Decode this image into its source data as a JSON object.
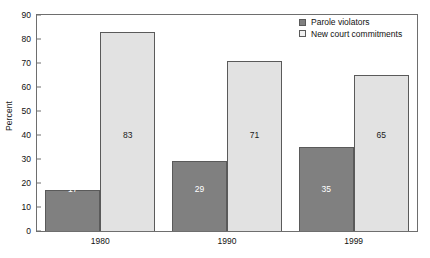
{
  "chart_data": {
    "type": "bar",
    "title": "",
    "subtitle": "",
    "xlabel": "",
    "ylabel": "Percent",
    "categories": [
      "1980",
      "1990",
      "1999"
    ],
    "series": [
      {
        "name": "Parole violators",
        "color": "#808080",
        "values": [
          17,
          29,
          35
        ],
        "value_labels": [
          "17",
          "29",
          "35"
        ]
      },
      {
        "name": "New court commitments",
        "color": "#e2e2e2",
        "values": [
          83,
          71,
          65
        ],
        "value_labels": [
          "83",
          "71",
          "65"
        ]
      }
    ],
    "ylim": [
      0,
      90
    ],
    "ytick_step": 10,
    "ytick_labels": [
      "0",
      "10",
      "20",
      "30",
      "40",
      "50",
      "60",
      "70",
      "80",
      "90"
    ],
    "grid": false,
    "legend_position": "top-right",
    "frame": true,
    "annotations": []
  },
  "legend": {
    "items": [
      {
        "label": "Parole violators",
        "swatch": "dark-gray-swatch"
      },
      {
        "label": "New court commitments",
        "swatch": "light-gray-swatch"
      }
    ]
  },
  "axes": {
    "y_title": "Percent"
  }
}
